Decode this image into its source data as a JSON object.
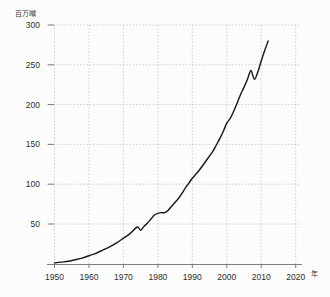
{
  "chart_data": {
    "type": "line",
    "title": "",
    "subtitle": "",
    "xlabel": "年",
    "ylabel": "百万噸",
    "ylabel_note": "million tons",
    "xlim": [
      1945,
      2022
    ],
    "ylim": [
      0,
      310
    ],
    "grid": true,
    "legend": "none",
    "line_color": "#1a1a1a",
    "axis_color": "#8a8a8a",
    "grid_color": "#b9b9b9",
    "x_ticks": [
      1950,
      1960,
      1970,
      1980,
      1990,
      2000,
      2010,
      2020
    ],
    "x_tick_labels": [
      "1950",
      "1960",
      "1970",
      "1980",
      "1990",
      "2000",
      "2010",
      "2020"
    ],
    "y_ticks": [
      50,
      100,
      150,
      200,
      250,
      300
    ],
    "y_tick_labels": [
      "50",
      "100",
      "150",
      "200",
      "250",
      "300"
    ],
    "x": [
      1950,
      1952,
      1954,
      1956,
      1958,
      1960,
      1962,
      1964,
      1966,
      1968,
      1970,
      1972,
      1974,
      1975,
      1976,
      1977,
      1978,
      1979,
      1980,
      1981,
      1982,
      1983,
      1984,
      1985,
      1986,
      1987,
      1988,
      1989,
      1990,
      1991,
      1992,
      1993,
      1994,
      1995,
      1996,
      1997,
      1998,
      1999,
      2000,
      2001,
      2002,
      2003,
      2004,
      2005,
      2006,
      2007,
      2008,
      2009,
      2010,
      2011,
      2012
    ],
    "values": [
      2,
      3,
      4,
      6,
      8,
      11,
      14,
      18,
      22,
      27,
      33,
      39,
      47,
      43,
      48,
      52,
      57,
      62,
      64,
      65,
      65,
      68,
      73,
      78,
      83,
      89,
      96,
      102,
      108,
      113,
      118,
      124,
      130,
      136,
      142,
      150,
      158,
      167,
      177,
      183,
      192,
      202,
      213,
      222,
      232,
      243,
      232,
      241,
      255,
      268,
      280
    ],
    "series": [
      {
        "name": "世界生産量",
        "units": "百万噸",
        "values": [
          2,
          3,
          4,
          6,
          8,
          11,
          14,
          18,
          22,
          27,
          33,
          39,
          47,
          43,
          48,
          52,
          57,
          62,
          64,
          65,
          65,
          68,
          73,
          78,
          83,
          89,
          96,
          102,
          108,
          113,
          118,
          124,
          130,
          136,
          142,
          150,
          158,
          167,
          177,
          183,
          192,
          202,
          213,
          222,
          232,
          243,
          232,
          241,
          255,
          268,
          280
        ]
      }
    ],
    "annotations": [
      {
        "label": "1975 dip",
        "x": 1975,
        "y": 43
      },
      {
        "label": "1980-1982 plateau",
        "x": 1981,
        "y": 65
      },
      {
        "label": "2008 dip",
        "x": 2008,
        "y": 232
      },
      {
        "label": "series end",
        "x": 2012,
        "y": 280
      }
    ]
  },
  "axes": {
    "y_unit_label": "百万噸",
    "x_unit_label": "年"
  }
}
